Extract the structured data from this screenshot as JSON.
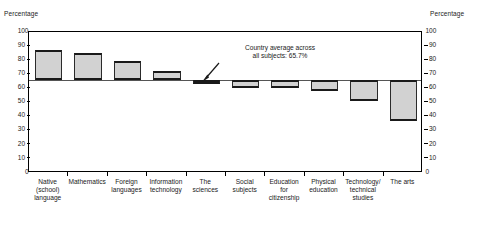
{
  "axes": {
    "left_caption": "Percentage",
    "right_caption": "Percentage",
    "tick_labels": [
      "100",
      "90",
      "80",
      "70",
      "60",
      "50",
      "40",
      "30",
      "20",
      "10",
      "0"
    ],
    "ymin": 0,
    "ymax": 100,
    "tick_step": 10
  },
  "annotation": {
    "text": "Country average across\nall subjects: 65.7%",
    "value": 65.7
  },
  "chart_data": {
    "type": "bar",
    "title": "",
    "subtitle": "",
    "xlabel": "",
    "ylabel": "Percentage",
    "ylim": [
      0,
      100
    ],
    "grid": false,
    "legend": "none",
    "baseline": 65.7,
    "baseline_label": "Country average across all subjects: 65.7%",
    "categories": [
      "Native\n(school)\nlanguage",
      "Mathematics",
      "Foreign\nlanguages",
      "Information\ntechnology",
      "The\nsciences",
      "Social\nsubjects",
      "Education\nfor\ncitizenship",
      "Physical\neducation",
      "Technology/\ntechnical\nstudies",
      "The arts"
    ],
    "categories_flat": [
      "Native (school) language",
      "Mathematics",
      "Foreign languages",
      "Information technology",
      "The sciences",
      "Social subjects",
      "Education for citizenship",
      "Physical education",
      "Technology/technical studies",
      "The arts"
    ],
    "values": [
      87,
      85,
      79.5,
      72,
      64,
      60.5,
      60,
      58.5,
      51,
      37
    ],
    "series": [
      {
        "name": "Percentage",
        "values": [
          87,
          85,
          79.5,
          72,
          64,
          60.5,
          60,
          58.5,
          51,
          37
        ]
      }
    ]
  },
  "style": {
    "bar_fill": "#d2d2d2",
    "bar_edge": "#1a1a1a",
    "axis_color": "#000000",
    "baseline_color": "#555555",
    "text_color": "#1a1a1a",
    "background": "#ffffff"
  }
}
